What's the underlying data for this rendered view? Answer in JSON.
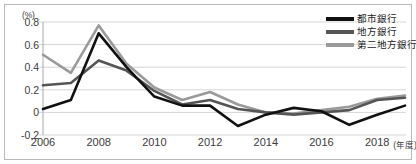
{
  "chart": {
    "type": "line",
    "unit_label": "(%)",
    "x_unit_label": "(年度)",
    "y_ticks": [
      "0.8",
      "0.6",
      "0.4",
      "0.2",
      "0",
      "-0.2"
    ],
    "x_ticks": [
      "2006",
      "2008",
      "2010",
      "2012",
      "2014",
      "2016",
      "2018"
    ],
    "legend": [
      {
        "label": "都市銀行",
        "color": "#111111"
      },
      {
        "label": "地方銀行",
        "color": "#555555"
      },
      {
        "label": "第二地方銀行",
        "color": "#9a9a9a"
      }
    ]
  },
  "chart_data": {
    "type": "line",
    "title": "",
    "xlabel": "(年度)",
    "ylabel": "(%)",
    "ylim": [
      -0.2,
      0.8
    ],
    "xlim": [
      2006,
      2019
    ],
    "grid": true,
    "legend_position": "top-right",
    "x": [
      2006,
      2007,
      2008,
      2009,
      2010,
      2011,
      2012,
      2013,
      2014,
      2015,
      2016,
      2017,
      2018,
      2019
    ],
    "x_tick_labels": [
      "2006",
      "2008",
      "2010",
      "2012",
      "2014",
      "2016",
      "2018"
    ],
    "y_tick_labels": [
      "-0.2",
      "0",
      "0.2",
      "0.4",
      "0.6",
      "0.8"
    ],
    "series": [
      {
        "name": "都市銀行",
        "color": "#111111",
        "values": [
          0.03,
          0.11,
          0.7,
          0.4,
          0.14,
          0.06,
          0.06,
          -0.12,
          -0.02,
          0.04,
          0.01,
          -0.11,
          -0.02,
          0.06
        ]
      },
      {
        "name": "地方銀行",
        "color": "#555555",
        "values": [
          0.24,
          0.26,
          0.46,
          0.37,
          0.19,
          0.07,
          0.11,
          0.03,
          0.0,
          -0.02,
          0.0,
          0.02,
          0.11,
          0.13
        ]
      },
      {
        "name": "第二地方銀行",
        "color": "#9a9a9a",
        "values": [
          0.51,
          0.35,
          0.77,
          0.43,
          0.22,
          0.11,
          0.18,
          0.07,
          0.0,
          -0.01,
          0.02,
          0.05,
          0.12,
          0.15
        ]
      }
    ]
  }
}
